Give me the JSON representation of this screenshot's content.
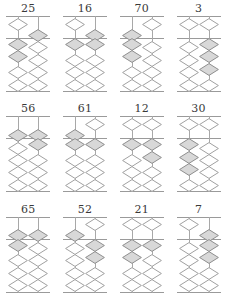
{
  "page": {
    "grid": {
      "rows": 3,
      "columns": 4
    }
  },
  "style": {
    "bead_active_fill": "#d8d8d8",
    "bead_inactive_fill": "#ffffff",
    "bead_stroke": "#a0a0a0",
    "frame_stroke": "#9a9a9a",
    "rod_stroke": "#a8a8a8",
    "label_color": "#3a3a3a",
    "background": "#ffffff"
  },
  "abacus_spec": {
    "rods": 2,
    "rod_names": [
      "tens",
      "ones"
    ],
    "heaven_beads_per_rod": 1,
    "heaven_bead_value": 5,
    "earth_beads_per_rod": 4,
    "earth_bead_value": 1
  },
  "abacuses": [
    {
      "label": "25",
      "value": 25,
      "rods": [
        {
          "name": "tens",
          "digit": 2,
          "heaven_active": false,
          "earth_active": 2
        },
        {
          "name": "ones",
          "digit": 5,
          "heaven_active": true,
          "earth_active": 0
        }
      ]
    },
    {
      "label": "16",
      "value": 16,
      "rods": [
        {
          "name": "tens",
          "digit": 1,
          "heaven_active": false,
          "earth_active": 1
        },
        {
          "name": "ones",
          "digit": 6,
          "heaven_active": true,
          "earth_active": 1
        }
      ]
    },
    {
      "label": "70",
      "value": 70,
      "rods": [
        {
          "name": "tens",
          "digit": 7,
          "heaven_active": true,
          "earth_active": 2
        },
        {
          "name": "ones",
          "digit": 0,
          "heaven_active": false,
          "earth_active": 0
        }
      ]
    },
    {
      "label": "3",
      "value": 3,
      "rods": [
        {
          "name": "tens",
          "digit": 0,
          "heaven_active": false,
          "earth_active": 0
        },
        {
          "name": "ones",
          "digit": 3,
          "heaven_active": false,
          "earth_active": 3
        }
      ]
    },
    {
      "label": "56",
      "value": 56,
      "rods": [
        {
          "name": "tens",
          "digit": 5,
          "heaven_active": true,
          "earth_active": 0
        },
        {
          "name": "ones",
          "digit": 6,
          "heaven_active": true,
          "earth_active": 1
        }
      ]
    },
    {
      "label": "61",
      "value": 61,
      "rods": [
        {
          "name": "tens",
          "digit": 6,
          "heaven_active": true,
          "earth_active": 1
        },
        {
          "name": "ones",
          "digit": 1,
          "heaven_active": false,
          "earth_active": 1
        }
      ]
    },
    {
      "label": "12",
      "value": 12,
      "rods": [
        {
          "name": "tens",
          "digit": 1,
          "heaven_active": false,
          "earth_active": 1
        },
        {
          "name": "ones",
          "digit": 2,
          "heaven_active": false,
          "earth_active": 2
        }
      ]
    },
    {
      "label": "30",
      "value": 30,
      "rods": [
        {
          "name": "tens",
          "digit": 3,
          "heaven_active": false,
          "earth_active": 3
        },
        {
          "name": "ones",
          "digit": 0,
          "heaven_active": false,
          "earth_active": 0
        }
      ]
    },
    {
      "label": "65",
      "value": 65,
      "rods": [
        {
          "name": "tens",
          "digit": 6,
          "heaven_active": true,
          "earth_active": 1
        },
        {
          "name": "ones",
          "digit": 5,
          "heaven_active": true,
          "earth_active": 0
        }
      ]
    },
    {
      "label": "52",
      "value": 52,
      "rods": [
        {
          "name": "tens",
          "digit": 5,
          "heaven_active": true,
          "earth_active": 0
        },
        {
          "name": "ones",
          "digit": 2,
          "heaven_active": false,
          "earth_active": 2
        }
      ]
    },
    {
      "label": "21",
      "value": 21,
      "rods": [
        {
          "name": "tens",
          "digit": 2,
          "heaven_active": false,
          "earth_active": 2
        },
        {
          "name": "ones",
          "digit": 1,
          "heaven_active": false,
          "earth_active": 1
        }
      ]
    },
    {
      "label": "7",
      "value": 7,
      "rods": [
        {
          "name": "tens",
          "digit": 0,
          "heaven_active": false,
          "earth_active": 0
        },
        {
          "name": "ones",
          "digit": 7,
          "heaven_active": true,
          "earth_active": 2
        }
      ]
    }
  ]
}
